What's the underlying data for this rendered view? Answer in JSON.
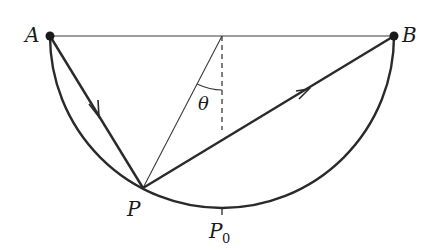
{
  "diagram": {
    "type": "geometry",
    "labels": {
      "A": "A",
      "B": "B",
      "P": "P",
      "P0_main": "P",
      "P0_sub": "0",
      "theta": "θ"
    },
    "colors": {
      "stroke": "#2a2a2a",
      "thin_stroke": "#3a3a3a",
      "background": "#ffffff"
    },
    "points": {
      "A": [
        50,
        36
      ],
      "B": [
        394,
        36
      ],
      "center": [
        222,
        36
      ],
      "P": [
        143,
        188
      ],
      "P0": [
        222,
        208
      ]
    }
  }
}
